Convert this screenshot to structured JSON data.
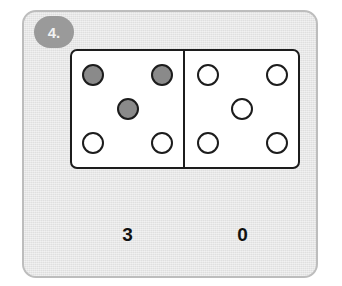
{
  "exercise": {
    "number_label": "4.",
    "badge_color": "#9a9a9a",
    "card_background": "#e6e6e6",
    "card_border_color": "#bdbdbd"
  },
  "domino": {
    "outline_color": "#1c1c1c",
    "face_color": "#ffffff",
    "filled_pip_color": "#8a8a8a",
    "empty_pip_color": "#ffffff",
    "pip_positions": [
      "top-left",
      "top-right",
      "center",
      "bottom-left",
      "bottom-right"
    ],
    "halves": [
      {
        "side": "left",
        "filled_count": 3,
        "total_pips": 5,
        "pips": [
          {
            "position": "top-left",
            "filled": true
          },
          {
            "position": "top-right",
            "filled": true
          },
          {
            "position": "center",
            "filled": true
          },
          {
            "position": "bottom-left",
            "filled": false
          },
          {
            "position": "bottom-right",
            "filled": false
          }
        ]
      },
      {
        "side": "right",
        "filled_count": 0,
        "total_pips": 5,
        "pips": [
          {
            "position": "top-left",
            "filled": false
          },
          {
            "position": "top-right",
            "filled": false
          },
          {
            "position": "center",
            "filled": false
          },
          {
            "position": "bottom-left",
            "filled": false
          },
          {
            "position": "bottom-right",
            "filled": false
          }
        ]
      }
    ]
  },
  "answers": {
    "left_value": "3",
    "right_value": "0"
  }
}
